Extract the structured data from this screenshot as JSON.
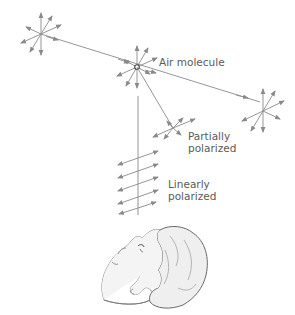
{
  "diagram": {
    "type": "sky-polarization-illustration",
    "colors": {
      "line": "#8a8a8a",
      "arrow": "#8a8a8a",
      "text": "#5a5a5a",
      "head_fill": "#f2f2f2",
      "head_stroke": "#7a7a7a"
    },
    "labels": {
      "air_molecule": "Air molecule",
      "partially_line1": "Partially",
      "partially_line2": "polarized",
      "linearly_line1": "Linearly",
      "linearly_line2": "polarized"
    },
    "nodes": [
      {
        "id": "source-unpolarized",
        "x": 41,
        "y": 34,
        "kind": "unpolarized-starburst"
      },
      {
        "id": "air-molecule",
        "x": 137,
        "y": 67,
        "kind": "scatterer"
      },
      {
        "id": "forward-unpolarized",
        "x": 260,
        "y": 102,
        "kind": "unpolarized-starburst"
      },
      {
        "id": "partially-polarized",
        "x": 172,
        "y": 128,
        "kind": "partial-starburst"
      }
    ],
    "beams": [
      {
        "from": "source-unpolarized",
        "to": "forward-unpolarized",
        "label": "incident sunlight"
      },
      {
        "from": "air-molecule",
        "to": "partially-polarized",
        "label": "scattered oblique"
      },
      {
        "from": "air-molecule",
        "to": "observer",
        "label": "scattered 90 degrees"
      }
    ],
    "linear_polarization_arrows": 5,
    "observer": "person looking up"
  }
}
